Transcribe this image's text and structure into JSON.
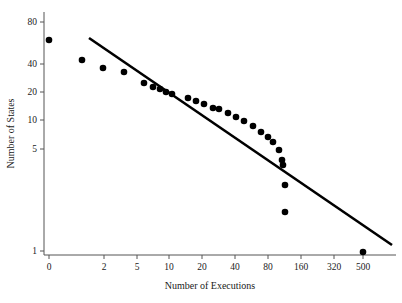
{
  "chart_data": {
    "type": "scatter",
    "title": "",
    "xlabel": "Number of Executions",
    "ylabel": "Number of States",
    "xscale": "log",
    "yscale": "log",
    "grid": false,
    "legend": null,
    "xticks": [
      {
        "label": "0",
        "px": 49
      },
      {
        "label": "2",
        "px": 104
      },
      {
        "label": "5",
        "px": 137
      },
      {
        "label": "10",
        "px": 169
      },
      {
        "label": "20",
        "px": 202
      },
      {
        "label": "40",
        "px": 235
      },
      {
        "label": "80",
        "px": 268
      },
      {
        "label": "160",
        "px": 301
      },
      {
        "label": "320",
        "px": 334
      },
      {
        "label": "500",
        "px": 363
      }
    ],
    "yticks": [
      {
        "label": "80",
        "px": 22
      },
      {
        "label": "40",
        "px": 64
      },
      {
        "label": "20",
        "px": 92
      },
      {
        "label": "10",
        "px": 120
      },
      {
        "label": "5",
        "px": 149
      },
      {
        "label": "1",
        "px": 251
      }
    ],
    "points": [
      {
        "x": 1,
        "y": 50,
        "px": 49,
        "py": 40
      },
      {
        "x": 2,
        "y": 37,
        "px": 82,
        "py": 60
      },
      {
        "x": 3,
        "y": 33,
        "px": 103,
        "py": 68
      },
      {
        "x": 4,
        "y": 32,
        "px": 124,
        "py": 72
      },
      {
        "x": 6,
        "y": 25,
        "px": 144,
        "py": 83
      },
      {
        "x": 7,
        "y": 23,
        "px": 153,
        "py": 87
      },
      {
        "x": 8,
        "y": 22,
        "px": 160,
        "py": 89
      },
      {
        "x": 9,
        "y": 21,
        "px": 166,
        "py": 92
      },
      {
        "x": 10,
        "y": 20,
        "px": 172,
        "py": 94
      },
      {
        "x": 13,
        "y": 19,
        "px": 188,
        "py": 98
      },
      {
        "x": 15,
        "y": 18,
        "px": 196,
        "py": 101
      },
      {
        "x": 17,
        "y": 17,
        "px": 204,
        "py": 104
      },
      {
        "x": 20,
        "y": 16,
        "px": 213,
        "py": 108
      },
      {
        "x": 23,
        "y": 16,
        "px": 219,
        "py": 109
      },
      {
        "x": 26,
        "y": 15,
        "px": 228,
        "py": 113
      },
      {
        "x": 30,
        "y": 14,
        "px": 236,
        "py": 117
      },
      {
        "x": 35,
        "y": 13,
        "px": 244,
        "py": 121
      },
      {
        "x": 42,
        "y": 12,
        "px": 253,
        "py": 126
      },
      {
        "x": 50,
        "y": 11,
        "px": 261,
        "py": 132
      },
      {
        "x": 60,
        "y": 10,
        "px": 268,
        "py": 137
      },
      {
        "x": 70,
        "y": 9,
        "px": 273,
        "py": 142
      },
      {
        "x": 80,
        "y": 8,
        "px": 279,
        "py": 150
      },
      {
        "x": 85,
        "y": 7,
        "px": 282,
        "py": 160
      },
      {
        "x": 90,
        "y": 7,
        "px": 283,
        "py": 165
      },
      {
        "x": 100,
        "y": 5,
        "px": 285,
        "py": 185
      },
      {
        "x": 110,
        "y": 3,
        "px": 285,
        "py": 212
      },
      {
        "x": 500,
        "y": 1,
        "px": 363,
        "py": 252
      }
    ],
    "fit_line": {
      "label": "power-law fit",
      "x1_px": 89,
      "y1_px": 38,
      "x2_px": 392,
      "y2_px": 245
    },
    "plot_area": {
      "left": 44,
      "right": 396,
      "top": 12,
      "bottom": 255
    }
  }
}
